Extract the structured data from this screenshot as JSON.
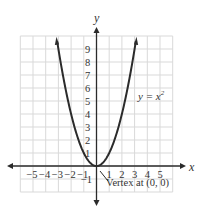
{
  "chart_data": {
    "type": "line",
    "title": "",
    "equation_label": "y = x",
    "equation_exponent": "2",
    "xlabel": "x",
    "ylabel": "y",
    "x_ticks": [
      "−5",
      "−4",
      "−3",
      "−2",
      "−1",
      "1",
      "2",
      "3",
      "4",
      "5"
    ],
    "y_ticks": [
      "1",
      "2",
      "3",
      "4",
      "5",
      "6",
      "7",
      "8",
      "9"
    ],
    "y_neg_tick": "−1",
    "xlim": [
      -6,
      6
    ],
    "ylim": [
      -2,
      10
    ],
    "grid": true,
    "series": [
      {
        "name": "y = x^2",
        "x": [
          -3.1,
          -3,
          -2.5,
          -2,
          -1.5,
          -1,
          -0.5,
          0,
          0.5,
          1,
          1.5,
          2,
          2.5,
          3,
          3.1
        ],
        "values": [
          9.61,
          9,
          6.25,
          4,
          2.25,
          1,
          0.25,
          0,
          0.25,
          1,
          2.25,
          4,
          6.25,
          9,
          9.61
        ]
      }
    ],
    "annotations": [
      {
        "text": "Vertex at (0, 0)",
        "x": 0,
        "y": 0
      }
    ]
  },
  "colors": {
    "curve": "#2b2b2b",
    "axis": "#2b2b2b",
    "grid": "#d9d9d9"
  }
}
